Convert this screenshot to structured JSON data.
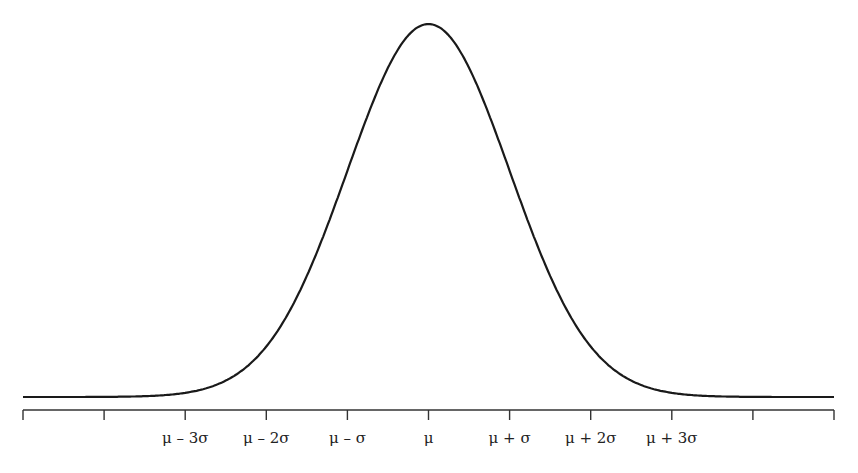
{
  "chart_data": {
    "type": "line",
    "title": "",
    "xlabel": "",
    "ylabel": "",
    "series": [
      {
        "name": "normal density",
        "mean": 0,
        "sd": 1,
        "x": [
          -5,
          -4,
          -3,
          -2,
          -1,
          0,
          1,
          2,
          3,
          4,
          5
        ],
        "values": [
          1.5e-06,
          0.000134,
          0.00443,
          0.054,
          0.242,
          0.399,
          0.242,
          0.054,
          0.00443,
          0.000134,
          1.5e-06
        ]
      }
    ],
    "xlim": [
      -5,
      5
    ],
    "ticks": [
      -5,
      -4,
      -3,
      -2,
      -1,
      0,
      1,
      2,
      3,
      4,
      5
    ],
    "tick_labels": [
      "",
      "",
      "μ – 3σ",
      "μ – 2σ",
      "μ – σ",
      "μ",
      "μ + σ",
      "μ + 2σ",
      "μ + 3σ",
      "",
      ""
    ],
    "grid": false,
    "legend": null
  },
  "colors": {
    "line": "#1a1a1a",
    "axis": "#333333",
    "background": "#ffffff"
  }
}
